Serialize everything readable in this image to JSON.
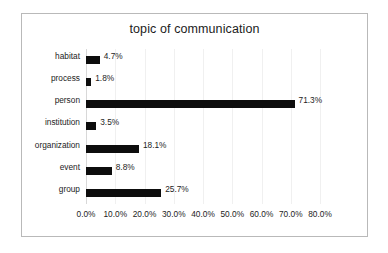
{
  "chart_data": {
    "type": "bar",
    "orientation": "horizontal",
    "title": "topic of communication",
    "xlabel": "",
    "ylabel": "",
    "categories": [
      "habitat",
      "process",
      "person",
      "institution",
      "organization",
      "event",
      "group"
    ],
    "values": [
      4.7,
      1.8,
      71.3,
      3.5,
      18.1,
      8.8,
      25.7
    ],
    "data_labels": [
      "4.7%",
      "1.8%",
      "71.3%",
      "3.5%",
      "18.1%",
      "8.8%",
      "25.7%"
    ],
    "xlim": [
      0,
      80
    ],
    "xticks": [
      0,
      10,
      20,
      30,
      40,
      50,
      60,
      70,
      80
    ],
    "xtick_labels": [
      "0.0%",
      "10.0%",
      "20.0%",
      "30.0%",
      "40.0%",
      "50.0%",
      "60.0%",
      "70.0%",
      "80.0%"
    ],
    "grid": true,
    "legend": false,
    "bar_color": "#0d0d0d",
    "border_color": "#b9b9b9",
    "gridline_color": "#f0f0f0",
    "text_color": "#1c1c1c"
  }
}
